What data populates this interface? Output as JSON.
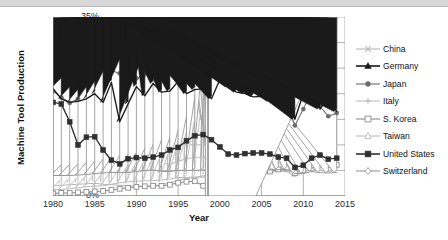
{
  "chart_data": {
    "type": "line",
    "title": "",
    "xlabel": "Year",
    "ylabel": "Machine Tool Production",
    "xlim": [
      1980,
      2015
    ],
    "ylim": [
      0,
      35
    ],
    "grid": true,
    "legend_position": "right",
    "y_tick_labels": [
      "0%",
      "5%",
      "10%",
      "15%",
      "20%",
      "25%",
      "30%",
      "35%"
    ],
    "y_ticks": [
      0,
      5,
      10,
      15,
      20,
      25,
      30,
      35
    ],
    "x_tick_labels": [
      "1980",
      "1985",
      "1990",
      "1995",
      "2000",
      "2005",
      "2010",
      "2015"
    ],
    "x_ticks": [
      1980,
      1985,
      1990,
      1995,
      2000,
      2005,
      2010,
      2015
    ],
    "x": [
      1980,
      1981,
      1982,
      1983,
      1984,
      1985,
      1986,
      1987,
      1988,
      1989,
      1990,
      1991,
      1992,
      1993,
      1994,
      1995,
      1996,
      1997,
      1998,
      1999,
      2000,
      2001,
      2002,
      2003,
      2004,
      2005,
      2006,
      2007,
      2008,
      2009,
      2010,
      2011,
      2012,
      2013,
      2014
    ],
    "series": [
      {
        "name": "China",
        "marker": "x",
        "color": "#b8b8b8",
        "values": [
          2.0,
          2.1,
          2.2,
          2.3,
          2.4,
          2.5,
          2.3,
          2.2,
          2.1,
          2.0,
          1.9,
          1.8,
          1.9,
          2.2,
          2.6,
          3.0,
          3.4,
          3.6,
          3.9,
          4.2,
          4.5,
          5.0,
          5.6,
          6.4,
          7.2,
          8.4,
          9.6,
          11.0,
          12.5,
          21.0,
          30.5,
          30.0,
          28.5,
          29.5,
          30.0
        ]
      },
      {
        "name": "Germany",
        "marker": "triangle",
        "color": "#1a1a1a",
        "values": [
          21.0,
          19.0,
          18.3,
          18.5,
          19.0,
          20.0,
          18.3,
          22.2,
          14.5,
          18.0,
          21.4,
          19.6,
          22.0,
          20.3,
          20.5,
          22.4,
          20.0,
          20.8,
          21.0,
          19.0,
          22.8,
          21.3,
          20.3,
          20.0,
          19.4,
          19.5,
          18.5,
          20.2,
          20.0,
          15.0,
          20.0,
          24.0,
          17.0,
          19.5,
          16.5
        ]
      },
      {
        "name": "Japan",
        "marker": "circle",
        "color": "#6b6b6b",
        "values": [
          20.5,
          19.3,
          18.2,
          19.0,
          21.5,
          23.3,
          24.8,
          24.5,
          24.0,
          24.0,
          23.0,
          23.8,
          23.8,
          27.3,
          24.6,
          24.2,
          24.3,
          24.3,
          23.5,
          23.6,
          26.5,
          24.0,
          22.5,
          22.8,
          22.4,
          21.6,
          20.7,
          20.0,
          18.5,
          13.8,
          17.0,
          20.5,
          17.5,
          15.6,
          16.2
        ]
      },
      {
        "name": "Italy",
        "marker": "plus",
        "color": "#bdbdbd",
        "values": [
          6.6,
          6.6,
          6.0,
          5.6,
          5.5,
          5.6,
          6.0,
          6.8,
          7.6,
          8.2,
          8.3,
          8.0,
          7.5,
          6.4,
          6.2,
          6.8,
          7.3,
          7.5,
          7.6,
          7.5,
          7.2,
          7.0,
          6.8,
          7.2,
          7.6,
          7.5,
          7.6,
          7.6,
          7.6,
          7.2,
          6.6,
          7.0,
          6.5,
          6.2,
          6.3
        ]
      },
      {
        "name": "S. Korea",
        "marker": "square-open",
        "color": "#8c8c8c",
        "values": [
          0.5,
          0.6,
          0.6,
          0.7,
          0.8,
          0.9,
          1.0,
          1.2,
          1.4,
          1.6,
          1.8,
          1.9,
          2.0,
          2.0,
          2.2,
          2.6,
          2.8,
          2.9,
          2.0,
          2.4,
          3.0,
          3.2,
          3.3,
          3.6,
          4.0,
          4.4,
          4.8,
          5.2,
          5.4,
          4.5,
          5.0,
          6.0,
          6.2,
          6.0,
          6.1
        ]
      },
      {
        "name": "Taiwan",
        "marker": "triangle-open",
        "color": "#bcbcbc",
        "values": [
          1.2,
          1.3,
          1.4,
          1.6,
          1.8,
          1.9,
          2.0,
          2.3,
          2.6,
          2.8,
          2.9,
          3.0,
          3.0,
          3.1,
          3.3,
          3.6,
          3.6,
          3.7,
          3.7,
          3.6,
          4.0,
          3.6,
          3.6,
          3.8,
          4.2,
          4.4,
          4.6,
          4.8,
          4.8,
          3.8,
          4.6,
          5.4,
          5.0,
          4.8,
          5.0
        ]
      },
      {
        "name": "United States",
        "marker": "square",
        "color": "#303030",
        "values": [
          18.3,
          18.0,
          14.5,
          10.0,
          11.5,
          11.6,
          9.0,
          7.0,
          6.3,
          7.3,
          7.5,
          7.4,
          7.6,
          8.0,
          9.0,
          9.5,
          10.8,
          11.8,
          12.0,
          11.0,
          9.6,
          8.2,
          8.0,
          8.3,
          8.4,
          8.4,
          8.2,
          7.6,
          7.4,
          5.6,
          6.0,
          7.4,
          8.0,
          7.2,
          7.4
        ]
      },
      {
        "name": "Switzerland",
        "marker": "diamond",
        "color": "#9a9a9a",
        "values": [
          4.0,
          4.0,
          4.0,
          4.1,
          4.2,
          4.4,
          4.5,
          4.6,
          4.6,
          4.6,
          4.8,
          5.0,
          5.1,
          4.8,
          4.8,
          5.0,
          5.0,
          5.0,
          5.1,
          5.0,
          5.0,
          5.0,
          4.9,
          4.9,
          5.0,
          5.0,
          5.1,
          5.2,
          5.2,
          4.4,
          4.4,
          4.8,
          4.6,
          4.5,
          4.6
        ]
      }
    ]
  },
  "axis": {
    "y_title": "Machine Tool Production",
    "x_title": "Year"
  }
}
